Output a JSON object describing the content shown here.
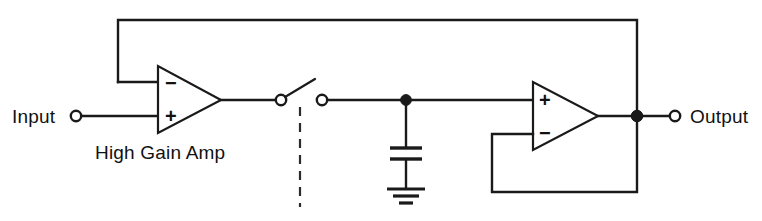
{
  "diagram": {
    "background_color": "#ffffff",
    "line_color": "#1a1a1a",
    "labels": {
      "input": "Input",
      "output": "Output",
      "amplifier_caption": "High Gain Amp"
    },
    "pins": {
      "amp1_inverting": "−",
      "amp1_noninverting": "+",
      "amp2_noninverting": "+",
      "amp2_inverting": "−"
    },
    "components": [
      {
        "name": "input-terminal",
        "type": "terminal",
        "label": "Input"
      },
      {
        "name": "high-gain-amplifier",
        "type": "op-amp",
        "label": "High Gain Amp"
      },
      {
        "name": "sampling-switch",
        "type": "spst-switch",
        "label": ""
      },
      {
        "name": "switch-control-dashed-line",
        "type": "mechanical-link",
        "label": ""
      },
      {
        "name": "hold-capacitor",
        "type": "capacitor",
        "label": ""
      },
      {
        "name": "ground-symbol",
        "type": "ground",
        "label": ""
      },
      {
        "name": "buffer-amplifier",
        "type": "op-amp",
        "label": ""
      },
      {
        "name": "output-terminal",
        "type": "terminal",
        "label": "Output"
      },
      {
        "name": "global-feedback-wire",
        "type": "wire",
        "label": ""
      },
      {
        "name": "buffer-feedback-wire",
        "type": "wire",
        "label": ""
      }
    ]
  }
}
